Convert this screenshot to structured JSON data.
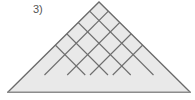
{
  "figure": {
    "label": "3)",
    "shape_name": "triangle",
    "colors": {
      "background": "#ffffff",
      "tile_fill": "#e9e9e9",
      "grid_line": "#6e6e6e",
      "outline": "#6b6b6b",
      "base_line": "#8c8c8c",
      "label_text": "#555555"
    },
    "geometry": {
      "apex": [
        99,
        2
      ],
      "base_left": [
        8,
        92
      ],
      "base_right": [
        190,
        92
      ],
      "rows": 4,
      "grid_divisions": 4,
      "grid_angle_degrees": 45,
      "base_triangles": 8,
      "tile_fill_opacity": 1
    },
    "grid_lines": {
      "left_to_right_count": 3,
      "right_to_left_count": 3,
      "base_segments": 8
    }
  }
}
